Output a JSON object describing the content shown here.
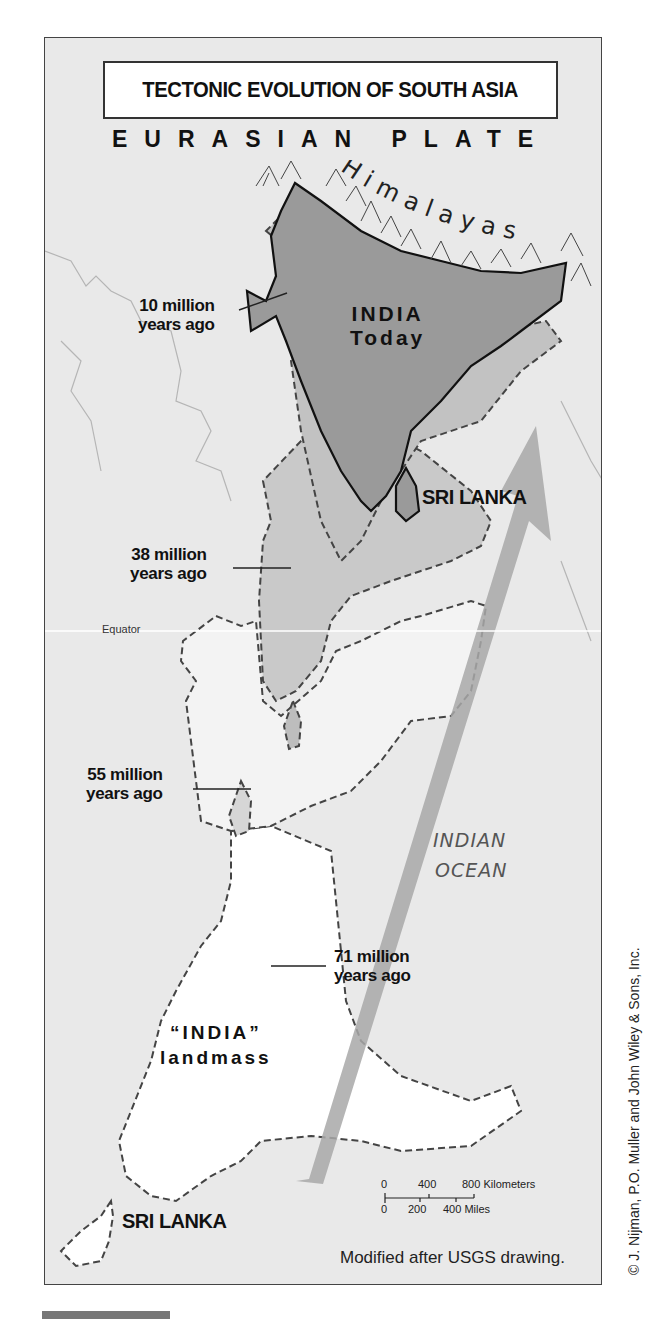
{
  "map": {
    "title": "TECTONIC EVOLUTION OF SOUTH ASIA",
    "plate_label": "EURASIAN PLATE",
    "mountain_label": "Himalayas",
    "india_today": {
      "line1": "INDIA",
      "line2": "Today"
    },
    "ages": [
      {
        "line1": "10 million",
        "line2": "years ago"
      },
      {
        "line1": "38 million",
        "line2": "years ago"
      },
      {
        "line1": "55 million",
        "line2": "years ago"
      },
      {
        "line1": "71 million",
        "line2": "years ago"
      }
    ],
    "sri_lanka_today": "SRI LANKA",
    "sri_lanka_past": "SRI LANKA",
    "equator": "Equator",
    "ocean": {
      "line1": "INDIAN",
      "line2": "OCEAN"
    },
    "landmass": {
      "line1": "“INDIA”",
      "line2": "landmass"
    },
    "scale": {
      "km_ticks": [
        "0",
        "400",
        "800 Kilometers"
      ],
      "mile_ticks": [
        "0",
        "200",
        "400 Miles"
      ]
    },
    "source_note": "Modified after USGS drawing.",
    "copyright": "© J. Nijman, P.O. Muller and John Wiley & Sons, Inc.",
    "colors": {
      "background": "#e9e9e9",
      "india_today_fill": "#9a9a9a",
      "past_fill": "#c4c4c4",
      "landmass_fill": "#ffffff",
      "arrow": "#a8a8a8"
    }
  }
}
